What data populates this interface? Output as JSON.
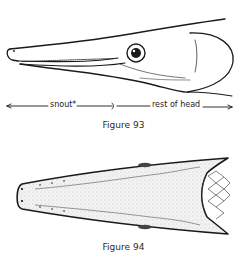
{
  "figure93": {
    "caption": "Figure 93",
    "labels": {
      "snout": "snout*",
      "rest_of_head": "rest of head"
    },
    "subject": "lateral view of gar head"
  },
  "figure94": {
    "caption": "Figure 94",
    "subject": "dorsal view of gar head"
  },
  "colors": {
    "ink": "#1a1a1a",
    "background": "#ffffff",
    "stipple": "#9a9a9a"
  }
}
